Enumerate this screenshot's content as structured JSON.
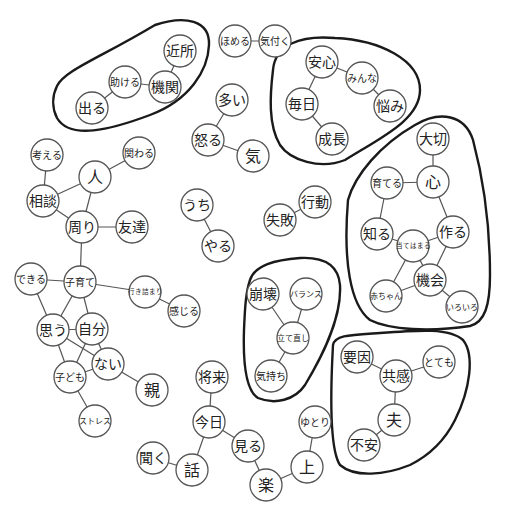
{
  "diagram": {
    "type": "co-occurrence-network",
    "colors": {
      "node_stroke": "#555555",
      "edge": "#555555",
      "cluster_outline": "#1a1a1a",
      "background": "#ffffff"
    },
    "nodes": [
      {
        "id": "kinjo",
        "label": "近所",
        "x": 180,
        "y": 51,
        "r": 16
      },
      {
        "id": "kikan",
        "label": "機関",
        "x": 165,
        "y": 87,
        "r": 16
      },
      {
        "id": "tasukeru",
        "label": "助ける",
        "x": 125,
        "y": 82,
        "r": 16
      },
      {
        "id": "deru",
        "label": "出る",
        "x": 92,
        "y": 108,
        "r": 16
      },
      {
        "id": "homeru",
        "label": "ほめる",
        "x": 235,
        "y": 41,
        "r": 16
      },
      {
        "id": "kizuku",
        "label": "気付く",
        "x": 275,
        "y": 41,
        "r": 16
      },
      {
        "id": "oi",
        "label": "多い",
        "x": 232,
        "y": 100,
        "r": 16
      },
      {
        "id": "okoru",
        "label": "怒る",
        "x": 208,
        "y": 140,
        "r": 16
      },
      {
        "id": "ki",
        "label": "気",
        "x": 253,
        "y": 156,
        "r": 16
      },
      {
        "id": "anshin",
        "label": "安心",
        "x": 322,
        "y": 62,
        "r": 16
      },
      {
        "id": "minna",
        "label": "みんな",
        "x": 362,
        "y": 78,
        "r": 16
      },
      {
        "id": "nayami",
        "label": "悩み",
        "x": 390,
        "y": 106,
        "r": 16
      },
      {
        "id": "mainichi",
        "label": "毎日",
        "x": 302,
        "y": 104,
        "r": 16
      },
      {
        "id": "seicho",
        "label": "成長",
        "x": 332,
        "y": 139,
        "r": 16
      },
      {
        "id": "kangaeru",
        "label": "考える",
        "x": 47,
        "y": 155,
        "r": 16
      },
      {
        "id": "kakawaru",
        "label": "関わる",
        "x": 139,
        "y": 153,
        "r": 16
      },
      {
        "id": "hito",
        "label": "人",
        "x": 95,
        "y": 177,
        "r": 16
      },
      {
        "id": "sodan",
        "label": "相談",
        "x": 43,
        "y": 201,
        "r": 16
      },
      {
        "id": "mawari",
        "label": "周り",
        "x": 82,
        "y": 227,
        "r": 16
      },
      {
        "id": "tomodachi",
        "label": "友達",
        "x": 132,
        "y": 227,
        "r": 16
      },
      {
        "id": "uchi",
        "label": "うち",
        "x": 197,
        "y": 205,
        "r": 16
      },
      {
        "id": "yaru",
        "label": "やる",
        "x": 218,
        "y": 246,
        "r": 16
      },
      {
        "id": "kodo",
        "label": "行動",
        "x": 315,
        "y": 202,
        "r": 16
      },
      {
        "id": "shippai",
        "label": "失敗",
        "x": 280,
        "y": 220,
        "r": 16
      },
      {
        "id": "taisetsu",
        "label": "大切",
        "x": 433,
        "y": 139,
        "r": 16
      },
      {
        "id": "kokoro",
        "label": "心",
        "x": 433,
        "y": 182,
        "r": 16
      },
      {
        "id": "sodateru",
        "label": "育てる",
        "x": 387,
        "y": 183,
        "r": 16
      },
      {
        "id": "shiru",
        "label": "知る",
        "x": 377,
        "y": 234,
        "r": 16
      },
      {
        "id": "tsukuru",
        "label": "作る",
        "x": 453,
        "y": 232,
        "r": 16
      },
      {
        "id": "atehamaru",
        "label": "当てはまる",
        "x": 413,
        "y": 246,
        "r": 16
      },
      {
        "id": "kikai",
        "label": "機会",
        "x": 430,
        "y": 280,
        "r": 16
      },
      {
        "id": "akachan",
        "label": "赤ちゃん",
        "x": 386,
        "y": 296,
        "r": 16
      },
      {
        "id": "iroiro",
        "label": "いろいろ",
        "x": 462,
        "y": 307,
        "r": 16
      },
      {
        "id": "dekiru",
        "label": "できる",
        "x": 31,
        "y": 279,
        "r": 16
      },
      {
        "id": "kosodate",
        "label": "子育て",
        "x": 80,
        "y": 282,
        "r": 16
      },
      {
        "id": "ikizumari",
        "label": "行き詰まり",
        "x": 145,
        "y": 292,
        "r": 16
      },
      {
        "id": "kanjiru",
        "label": "感じる",
        "x": 184,
        "y": 311,
        "r": 16
      },
      {
        "id": "omou",
        "label": "思う",
        "x": 53,
        "y": 330,
        "r": 16
      },
      {
        "id": "jibun",
        "label": "自分",
        "x": 92,
        "y": 329,
        "r": 16
      },
      {
        "id": "nai",
        "label": "ない",
        "x": 108,
        "y": 364,
        "r": 16
      },
      {
        "id": "kodomo",
        "label": "子ども",
        "x": 70,
        "y": 377,
        "r": 16
      },
      {
        "id": "oya",
        "label": "親",
        "x": 152,
        "y": 390,
        "r": 16
      },
      {
        "id": "stress",
        "label": "ストレス",
        "x": 95,
        "y": 421,
        "r": 16
      },
      {
        "id": "hokai",
        "label": "崩壊",
        "x": 263,
        "y": 294,
        "r": 16
      },
      {
        "id": "balance",
        "label": "バランス",
        "x": 306,
        "y": 294,
        "r": 16
      },
      {
        "id": "tatenaoshi",
        "label": "立て直し",
        "x": 293,
        "y": 338,
        "r": 16
      },
      {
        "id": "kimochi",
        "label": "気持ち",
        "x": 271,
        "y": 376,
        "r": 16
      },
      {
        "id": "yoin",
        "label": "要因",
        "x": 357,
        "y": 357,
        "r": 16
      },
      {
        "id": "kyokan",
        "label": "共感",
        "x": 396,
        "y": 376,
        "r": 16
      },
      {
        "id": "totemo",
        "label": "とても",
        "x": 439,
        "y": 362,
        "r": 16
      },
      {
        "id": "otto",
        "label": "夫",
        "x": 394,
        "y": 420,
        "r": 16
      },
      {
        "id": "fuan",
        "label": "不安",
        "x": 364,
        "y": 445,
        "r": 16
      },
      {
        "id": "shorai",
        "label": "将来",
        "x": 212,
        "y": 377,
        "r": 16
      },
      {
        "id": "kyo",
        "label": "今日",
        "x": 209,
        "y": 422,
        "r": 16
      },
      {
        "id": "miru",
        "label": "見る",
        "x": 248,
        "y": 446,
        "r": 16
      },
      {
        "id": "kiku",
        "label": "聞く",
        "x": 153,
        "y": 458,
        "r": 16
      },
      {
        "id": "hanashi",
        "label": "話",
        "x": 192,
        "y": 470,
        "r": 16
      },
      {
        "id": "raku",
        "label": "楽",
        "x": 266,
        "y": 485,
        "r": 16
      },
      {
        "id": "ue",
        "label": "上",
        "x": 307,
        "y": 467,
        "r": 16
      },
      {
        "id": "yutori",
        "label": "ゆとり",
        "x": 315,
        "y": 422,
        "r": 16
      }
    ],
    "edges": [
      [
        "kinjo",
        "kikan"
      ],
      [
        "kikan",
        "tasukeru"
      ],
      [
        "tasukeru",
        "deru"
      ],
      [
        "homeru",
        "kizuku"
      ],
      [
        "oi",
        "okoru"
      ],
      [
        "okoru",
        "ki"
      ],
      [
        "anshin",
        "minna"
      ],
      [
        "minna",
        "nayami"
      ],
      [
        "anshin",
        "mainichi"
      ],
      [
        "mainichi",
        "seicho"
      ],
      [
        "kangaeru",
        "sodan"
      ],
      [
        "sodan",
        "hito"
      ],
      [
        "hito",
        "kakawaru"
      ],
      [
        "hito",
        "mawari"
      ],
      [
        "sodan",
        "mawari"
      ],
      [
        "mawari",
        "tomodachi"
      ],
      [
        "mawari",
        "kosodate"
      ],
      [
        "uchi",
        "yaru"
      ],
      [
        "shippai",
        "kodo"
      ],
      [
        "taisetsu",
        "kokoro"
      ],
      [
        "kokoro",
        "sodateru"
      ],
      [
        "kokoro",
        "tsukuru"
      ],
      [
        "sodateru",
        "shiru"
      ],
      [
        "shiru",
        "atehamaru"
      ],
      [
        "atehamaru",
        "tsukuru"
      ],
      [
        "tsukuru",
        "kikai"
      ],
      [
        "atehamaru",
        "kikai"
      ],
      [
        "atehamaru",
        "akachan"
      ],
      [
        "kikai",
        "akachan"
      ],
      [
        "kikai",
        "iroiro"
      ],
      [
        "dekiru",
        "kosodate"
      ],
      [
        "dekiru",
        "omou"
      ],
      [
        "kosodate",
        "omou"
      ],
      [
        "kosodate",
        "jibun"
      ],
      [
        "kosodate",
        "ikizumari"
      ],
      [
        "ikizumari",
        "kanjiru"
      ],
      [
        "omou",
        "jibun"
      ],
      [
        "omou",
        "nai"
      ],
      [
        "omou",
        "kodomo"
      ],
      [
        "jibun",
        "kodomo"
      ],
      [
        "jibun",
        "nai"
      ],
      [
        "kodomo",
        "nai"
      ],
      [
        "nai",
        "oya"
      ],
      [
        "kodomo",
        "stress"
      ],
      [
        "hokai",
        "tatenaoshi"
      ],
      [
        "balance",
        "tatenaoshi"
      ],
      [
        "tatenaoshi",
        "kimochi"
      ],
      [
        "yoin",
        "kyokan"
      ],
      [
        "kyokan",
        "totemo"
      ],
      [
        "kyokan",
        "otto"
      ],
      [
        "otto",
        "fuan"
      ],
      [
        "shorai",
        "kyo"
      ],
      [
        "kyo",
        "miru"
      ],
      [
        "kyo",
        "hanashi"
      ],
      [
        "kiku",
        "hanashi"
      ],
      [
        "miru",
        "raku"
      ],
      [
        "raku",
        "ue"
      ],
      [
        "ue",
        "yutori"
      ]
    ],
    "clusters": [
      {
        "name": "cluster-kikan",
        "path": "M57,86 C65,70 100,58 155,25 C185,15 210,20 209,45 C208,70 190,100 150,115 C110,130 70,140 57,118 C52,108 52,96 57,86 Z"
      },
      {
        "name": "cluster-anshin",
        "path": "M273,70 C275,45 300,35 335,38 C380,40 420,60 420,90 C420,120 380,138 345,160 C320,170 290,160 280,145 C268,125 270,95 273,70 Z"
      },
      {
        "name": "cluster-kokoro",
        "path": "M348,200 C355,175 380,145 415,125 C440,110 465,115 473,140 C485,185 490,235 490,275 C490,305 485,322 470,326 C430,332 390,330 370,320 C350,305 343,260 348,200 Z"
      },
      {
        "name": "cluster-hokai",
        "path": "M250,280 C255,265 275,260 300,258 C320,257 338,262 340,285 C342,320 320,360 305,385 C295,400 275,405 258,398 C245,390 243,360 244,330 C245,305 246,292 250,280 Z"
      },
      {
        "name": "cluster-kyokan",
        "path": "M333,345 C335,335 350,335 380,333 C420,330 450,328 463,340 C475,355 470,390 455,420 C445,440 430,455 410,465 C385,475 355,478 340,465 C330,450 330,400 333,345 Z"
      }
    ]
  }
}
